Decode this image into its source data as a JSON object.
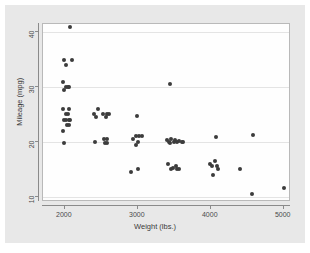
{
  "chart_data": {
    "type": "scatter",
    "title": "",
    "xlabel": "Weight (lbs.)",
    "ylabel": "Mileage (mpg)",
    "xlim": [
      1700,
      5100
    ],
    "ylim": [
      9,
      41.5
    ],
    "xticks": [
      2000,
      3000,
      4000,
      5000
    ],
    "yticks": [
      10,
      20,
      30,
      40
    ],
    "xtick_labels": [
      "2000",
      "3000",
      "4000",
      "5000"
    ],
    "ytick_labels": [
      "10",
      "20",
      "30",
      "40"
    ],
    "grid": "horizontal",
    "legend": "none",
    "marker": {
      "shape": "circle",
      "color": "#3c3c3c",
      "size_px": 4
    },
    "series": [
      {
        "name": "Mileage vs Weight",
        "points": [
          {
            "x": 2070,
            "y": 41
          },
          {
            "x": 1990,
            "y": 35
          },
          {
            "x": 2020,
            "y": 34
          },
          {
            "x": 2100,
            "y": 35
          },
          {
            "x": 1980,
            "y": 31
          },
          {
            "x": 2020,
            "y": 30
          },
          {
            "x": 2040,
            "y": 30
          },
          {
            "x": 1990,
            "y": 29.5
          },
          {
            "x": 2050,
            "y": 30
          },
          {
            "x": 1980,
            "y": 26
          },
          {
            "x": 2020,
            "y": 25
          },
          {
            "x": 2040,
            "y": 25
          },
          {
            "x": 2060,
            "y": 26
          },
          {
            "x": 1990,
            "y": 24
          },
          {
            "x": 2020,
            "y": 24
          },
          {
            "x": 2050,
            "y": 24
          },
          {
            "x": 2070,
            "y": 24
          },
          {
            "x": 2030,
            "y": 23
          },
          {
            "x": 2060,
            "y": 23
          },
          {
            "x": 1980,
            "y": 22
          },
          {
            "x": 1990,
            "y": 19.8
          },
          {
            "x": 2400,
            "y": 25
          },
          {
            "x": 2430,
            "y": 24.5
          },
          {
            "x": 2460,
            "y": 26
          },
          {
            "x": 2520,
            "y": 25
          },
          {
            "x": 2560,
            "y": 24.5
          },
          {
            "x": 2580,
            "y": 25
          },
          {
            "x": 2600,
            "y": 25
          },
          {
            "x": 2410,
            "y": 20
          },
          {
            "x": 2530,
            "y": 20.5
          },
          {
            "x": 2550,
            "y": 19.7
          },
          {
            "x": 2570,
            "y": 19.8
          },
          {
            "x": 2580,
            "y": 20.5
          },
          {
            "x": 2930,
            "y": 20.5
          },
          {
            "x": 2980,
            "y": 21
          },
          {
            "x": 3000,
            "y": 20
          },
          {
            "x": 3020,
            "y": 21
          },
          {
            "x": 3060,
            "y": 21
          },
          {
            "x": 2970,
            "y": 19.5
          },
          {
            "x": 2990,
            "y": 24.8
          },
          {
            "x": 2910,
            "y": 14.5
          },
          {
            "x": 3000,
            "y": 15
          },
          {
            "x": 3440,
            "y": 30.5
          },
          {
            "x": 3400,
            "y": 20.3
          },
          {
            "x": 3420,
            "y": 20
          },
          {
            "x": 3440,
            "y": 19.8
          },
          {
            "x": 3460,
            "y": 20.5
          },
          {
            "x": 3490,
            "y": 20
          },
          {
            "x": 3510,
            "y": 20.3
          },
          {
            "x": 3540,
            "y": 20
          },
          {
            "x": 3570,
            "y": 20.2
          },
          {
            "x": 3600,
            "y": 19.9
          },
          {
            "x": 3620,
            "y": 20
          },
          {
            "x": 3410,
            "y": 16
          },
          {
            "x": 3450,
            "y": 15
          },
          {
            "x": 3480,
            "y": 15.2
          },
          {
            "x": 3520,
            "y": 15.5
          },
          {
            "x": 3540,
            "y": 15
          },
          {
            "x": 3570,
            "y": 15
          },
          {
            "x": 3990,
            "y": 16
          },
          {
            "x": 4020,
            "y": 15.5
          },
          {
            "x": 4060,
            "y": 16.5
          },
          {
            "x": 4080,
            "y": 15.5
          },
          {
            "x": 4100,
            "y": 15
          },
          {
            "x": 4030,
            "y": 14
          },
          {
            "x": 4070,
            "y": 20.8
          },
          {
            "x": 4400,
            "y": 15
          },
          {
            "x": 4580,
            "y": 21.3
          },
          {
            "x": 4560,
            "y": 10.5
          },
          {
            "x": 5000,
            "y": 11.5
          }
        ]
      }
    ]
  },
  "axes": {
    "x_title": "Weight (lbs.)",
    "y_title": "Mileage (mpg)"
  }
}
